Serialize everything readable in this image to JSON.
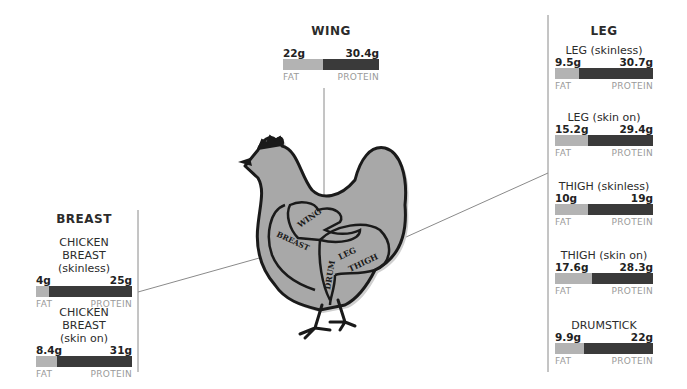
{
  "sections": {
    "wing": {
      "title": "WING",
      "items": [
        {
          "name": "",
          "fat": "22g",
          "protein": "30.4g",
          "fat_label": "FAT",
          "protein_label": "PROTEIN",
          "fat_pct": 42
        }
      ]
    },
    "leg": {
      "title": "LEG",
      "items": [
        {
          "name": "LEG (skinless)",
          "fat": "9.5g",
          "protein": "30.7g",
          "fat_label": "FAT",
          "protein_label": "PROTEIN",
          "fat_pct": 24
        },
        {
          "name": "LEG (skin on)",
          "fat": "15.2g",
          "protein": "29.4g",
          "fat_label": "FAT",
          "protein_label": "PROTEIN",
          "fat_pct": 34
        },
        {
          "name": "THIGH (skinless)",
          "fat": "10g",
          "protein": "19g",
          "fat_label": "FAT",
          "protein_label": "PROTEIN",
          "fat_pct": 34
        },
        {
          "name": "THIGH (skin on)",
          "fat": "17.6g",
          "protein": "28.3g",
          "fat_label": "FAT",
          "protein_label": "PROTEIN",
          "fat_pct": 38
        },
        {
          "name": "DRUMSTICK",
          "fat": "9.9g",
          "protein": "22g",
          "fat_label": "FAT",
          "protein_label": "PROTEIN",
          "fat_pct": 30
        }
      ]
    },
    "breast": {
      "title": "BREAST",
      "items": [
        {
          "name_line1": "CHICKEN BREAST",
          "name_line2": "(skinless)",
          "fat": "4g",
          "protein": "25g",
          "fat_label": "FAT",
          "protein_label": "PROTEIN",
          "fat_pct": 14
        },
        {
          "name_line1": "CHICKEN BREAST",
          "name_line2": "(skin on)",
          "fat": "8.4g",
          "protein": "31g",
          "fat_label": "FAT",
          "protein_label": "PROTEIN",
          "fat_pct": 22
        }
      ]
    }
  },
  "illustration": {
    "labels": {
      "wing": "WING",
      "breast": "BREAST",
      "leg": "LEG",
      "thigh": "THIGH",
      "drum": "DRUM"
    },
    "fill": "#a8a8a8",
    "outline": "#1a1a1a"
  },
  "colors": {
    "fat": "#b3b3b3",
    "protein": "#3a3a3a",
    "label_gray": "#9a9a9a",
    "line": "#8a8a8a"
  }
}
